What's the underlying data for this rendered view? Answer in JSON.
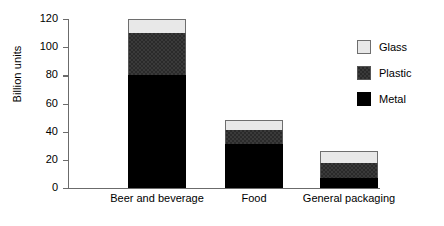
{
  "chart_data": {
    "type": "bar",
    "subtype": "stacked-vertical",
    "title": "",
    "xlabel": "",
    "ylabel": "Billion units",
    "ylim": [
      0,
      120
    ],
    "yticks": [
      0,
      20,
      40,
      60,
      80,
      100,
      120
    ],
    "ytick_labels": [
      "0",
      "20",
      "40",
      "60",
      "80",
      "100",
      "120"
    ],
    "grid": false,
    "legend_position": "right",
    "categories": [
      "Beer and beverage",
      "Food",
      "General packaging"
    ],
    "series": [
      {
        "name": "Metal",
        "color": "#000000",
        "values": [
          80,
          31,
          7
        ]
      },
      {
        "name": "Plastic",
        "color": "#2a2a2a",
        "values": [
          30,
          10,
          11
        ]
      },
      {
        "name": "Glass",
        "color": "#e8e8e8",
        "values": [
          10,
          7,
          8
        ]
      }
    ],
    "stack_totals": [
      120,
      48,
      26
    ]
  },
  "legend": {
    "items": [
      {
        "label": "Glass",
        "color": "#e8e8e8"
      },
      {
        "label": "Plastic",
        "color": "#2a2a2a"
      },
      {
        "label": "Metal",
        "color": "#000000"
      }
    ]
  },
  "axis": {
    "y_title": "Billion units",
    "y_tick_labels": [
      "120",
      "100",
      "80",
      "60",
      "40",
      "20",
      "0"
    ],
    "x_tick_labels": [
      "Beer and beverage",
      "Food",
      "General packaging"
    ]
  }
}
